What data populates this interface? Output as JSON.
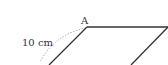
{
  "diagram": {
    "type": "parallelogram-fragment",
    "vertex_label": "A",
    "measure_label": "10 cm",
    "colors": {
      "edge": "#333333",
      "dotted": "#999999",
      "text": "#333333",
      "background": "#ffffff"
    }
  }
}
